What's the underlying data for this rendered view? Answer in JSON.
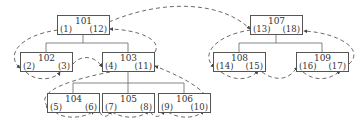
{
  "diagram": {
    "type": "tree-traversal",
    "edge_style": "dashed-arrows",
    "colors": {
      "line": "#555555",
      "text": "#333333",
      "background": "#ffffff"
    },
    "nodes": [
      {
        "id": "101",
        "left": "(1)",
        "right": "(12)",
        "x": 57,
        "y": 15
      },
      {
        "id": "102",
        "left": "(2)",
        "right": "(3)",
        "x": 20,
        "y": 52
      },
      {
        "id": "103",
        "left": "(4)",
        "right": "(11)",
        "x": 102,
        "y": 52
      },
      {
        "id": "104",
        "left": "(5)",
        "right": "(6)",
        "x": 47,
        "y": 93
      },
      {
        "id": "105",
        "left": "(7)",
        "right": "(8)",
        "x": 102,
        "y": 93
      },
      {
        "id": "106",
        "left": "(9)",
        "right": "(10)",
        "x": 158,
        "y": 93
      },
      {
        "id": "107",
        "left": "(13)",
        "right": "(18)",
        "x": 250,
        "y": 15
      },
      {
        "id": "108",
        "left": "(14)",
        "right": "(15)",
        "x": 213,
        "y": 52
      },
      {
        "id": "109",
        "left": "(16)",
        "right": "(17)",
        "x": 296,
        "y": 52
      }
    ],
    "tree_edges": [
      [
        "101",
        "102"
      ],
      [
        "101",
        "103"
      ],
      [
        "103",
        "104"
      ],
      [
        "103",
        "105"
      ],
      [
        "103",
        "106"
      ],
      [
        "107",
        "108"
      ],
      [
        "107",
        "109"
      ]
    ],
    "traversal_order": [
      "(1)",
      "(2)",
      "(3)",
      "(4)",
      "(5)",
      "(6)",
      "(7)",
      "(8)",
      "(9)",
      "(10)",
      "(11)",
      "(12)",
      "(13)",
      "(14)",
      "(15)",
      "(16)",
      "(17)",
      "(18)"
    ]
  }
}
